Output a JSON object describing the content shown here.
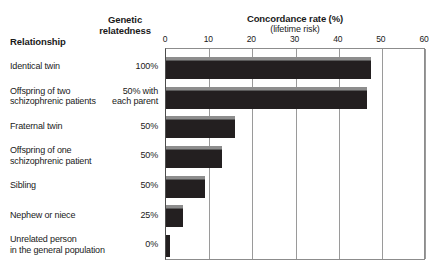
{
  "headers": {
    "relationship": "Relationship",
    "genetic_line1": "Genetic",
    "genetic_line2": "relatedness",
    "axis_title": "Concordance rate (%)",
    "axis_subtitle": "(lifetime risk)"
  },
  "chart_data": {
    "type": "bar",
    "orientation": "horizontal",
    "title": "Concordance rate (%)",
    "subtitle": "(lifetime risk)",
    "xlabel": "Concordance rate (%)",
    "ylabel": "Relationship",
    "xlim": [
      0,
      60
    ],
    "ticks": [
      "0",
      "10",
      "20",
      "30",
      "40",
      "50",
      "60"
    ],
    "tick_values": [
      0,
      10,
      20,
      30,
      40,
      50,
      60
    ],
    "grid": true,
    "legend": "none",
    "categories": [
      "Identical twin",
      "Offspring of two schizophrenic patients",
      "Fraternal twin",
      "Offspring of one schizophrenic patient",
      "Sibling",
      "Nephew or niece",
      "Unrelated person in the general population"
    ],
    "values": [
      47.5,
      46.5,
      16,
      13,
      9,
      4,
      1
    ],
    "genetic_relatedness": [
      "100%",
      "50% with each parent",
      "50%",
      "50%",
      "50%",
      "25%",
      "0%"
    ]
  },
  "rows": [
    {
      "label_lines": [
        "Identical twin"
      ],
      "genetic_lines": [
        "100%"
      ],
      "value": 47.5
    },
    {
      "label_lines": [
        "Offspring of two",
        "schizophrenic patients"
      ],
      "genetic_lines": [
        "50% with",
        "each parent"
      ],
      "value": 46.5
    },
    {
      "label_lines": [
        "Fraternal twin"
      ],
      "genetic_lines": [
        "50%"
      ],
      "value": 16
    },
    {
      "label_lines": [
        "Offspring of one",
        "schizophrenic patient"
      ],
      "genetic_lines": [
        "50%"
      ],
      "value": 13
    },
    {
      "label_lines": [
        "Sibling"
      ],
      "genetic_lines": [
        "50%"
      ],
      "value": 9
    },
    {
      "label_lines": [
        "Nephew or niece"
      ],
      "genetic_lines": [
        "25%"
      ],
      "value": 4
    },
    {
      "label_lines": [
        "Unrelated person",
        "in the general population"
      ],
      "genetic_lines": [
        "0%"
      ],
      "value": 1
    }
  ],
  "colors": {
    "bar": "#231f20",
    "bar_highlight": "#8d8d8d",
    "grid": "#9a9a9a",
    "axis": "#4d4d4d",
    "text": "#1a1a1a",
    "background": "#ffffff"
  }
}
